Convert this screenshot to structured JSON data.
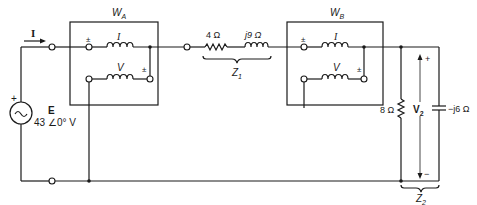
{
  "diagram": {
    "type": "circuit",
    "source": {
      "label": "E",
      "value": "43 ∠0° V",
      "polarity_plus": "+",
      "symbol": "~"
    },
    "current_label": "I",
    "wattmeter_a": {
      "label": "W",
      "subscript": "A",
      "current_coil_label": "I",
      "voltage_coil_label": "V",
      "pm_current": "±",
      "pm_voltage": "±"
    },
    "line_impedance": {
      "resistor": "4 Ω",
      "inductor": "j9 Ω",
      "label": "Z",
      "subscript": "1"
    },
    "wattmeter_b": {
      "label": "W",
      "subscript": "B",
      "current_coil_label": "I",
      "voltage_coil_label": "V",
      "pm_current": "±",
      "pm_voltage": "±"
    },
    "load": {
      "resistor": "8 Ω",
      "capacitor": "−j6 Ω",
      "voltage_label": "V",
      "voltage_subscript": "2",
      "plus": "+",
      "minus": "−",
      "label": "Z",
      "subscript": "2"
    }
  }
}
